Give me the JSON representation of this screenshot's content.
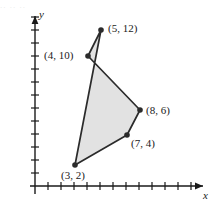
{
  "figure": {
    "background_color": "#ffffff",
    "stroke_color": "#2b2b2b",
    "fill_color": "#e2e2e2",
    "axis_color": "#1a1a1a"
  },
  "axes": {
    "x_label": "x",
    "y_label": "y",
    "origin_px": {
      "x": 35,
      "y": 186
    },
    "unit_px": 13,
    "x_tick_count": 12,
    "y_tick_count": 13,
    "x_arrow": "arrow-right",
    "y_arrow": "arrow-up"
  },
  "top_artifact": {
    "text": "..  ..       .."
  },
  "chart_data": {
    "type": "scatter",
    "title": "",
    "xlabel": "x",
    "ylabel": "y",
    "grid": false,
    "legend": null,
    "xlim": [
      0,
      12
    ],
    "ylim": [
      0,
      13
    ],
    "shape": "pentagon",
    "shape_fill": "#e2e2e2",
    "shape_outline": "#2b2b2b",
    "vertices": [
      {
        "label": "(5, 12)",
        "x": 5,
        "y": 12,
        "px": 101,
        "py": 30,
        "label_px": 108,
        "label_py": 23
      },
      {
        "label": "(4, 10)",
        "x": 4,
        "y": 10,
        "px": 88,
        "py": 56,
        "label_px": 44,
        "label_py": 50
      },
      {
        "label": "(8, 6)",
        "x": 8,
        "y": 6,
        "px": 140,
        "py": 110,
        "label_px": 146,
        "label_py": 105
      },
      {
        "label": "(7, 4)",
        "x": 7,
        "y": 4,
        "px": 127,
        "py": 135,
        "label_px": 131,
        "label_py": 138
      },
      {
        "label": "(3, 2)",
        "x": 3,
        "y": 2,
        "px": 75,
        "py": 165,
        "label_px": 61,
        "label_py": 170
      }
    ],
    "x_ticks": [
      1,
      2,
      3,
      4,
      5,
      6,
      7,
      8,
      9,
      10,
      11,
      12
    ],
    "y_ticks": [
      1,
      2,
      3,
      4,
      5,
      6,
      7,
      8,
      9,
      10,
      11,
      12,
      13
    ]
  }
}
